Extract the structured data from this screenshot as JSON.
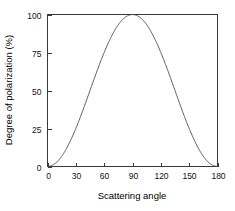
{
  "chart_data": {
    "type": "line",
    "title": "",
    "xlabel": "Scattering angle",
    "ylabel": "Degree of polarization (%)",
    "xlim": [
      0,
      180
    ],
    "ylim": [
      0,
      100
    ],
    "xticks": [
      0,
      30,
      60,
      90,
      120,
      150,
      180
    ],
    "yticks": [
      0,
      25,
      50,
      75,
      100
    ],
    "xtick_labels": [
      "0",
      "30",
      "60",
      "90",
      "120",
      "150",
      "180"
    ],
    "ytick_labels": [
      "0",
      "25",
      "50",
      "75",
      "100"
    ],
    "grid": false,
    "legend": false,
    "series": [
      {
        "name": "Degree of polarization",
        "color": "#4a4a4a",
        "x": [
          0,
          5,
          10,
          15,
          20,
          25,
          30,
          35,
          40,
          45,
          50,
          55,
          60,
          65,
          70,
          75,
          80,
          85,
          90,
          95,
          100,
          105,
          110,
          115,
          120,
          125,
          130,
          135,
          140,
          145,
          150,
          155,
          160,
          165,
          170,
          175,
          180
        ],
        "values": [
          0,
          0.8,
          3,
          6.7,
          11.7,
          17.9,
          25,
          32.9,
          41.3,
          50,
          58.7,
          67.1,
          75,
          82.1,
          88.3,
          93.3,
          97,
          99.2,
          100,
          99.2,
          97,
          93.3,
          88.3,
          82.1,
          75,
          67.1,
          58.7,
          50,
          41.3,
          32.9,
          25,
          17.9,
          11.7,
          6.7,
          3,
          0.8,
          0
        ]
      }
    ],
    "annotations": []
  },
  "axes": {
    "x_title": "Scattering angle",
    "y_title": "Degree of polarization  (%)"
  },
  "colors": {
    "background": "#ffffff",
    "frame": "#3a3a3a",
    "curve": "#4a4a4a",
    "text": "#000000"
  }
}
